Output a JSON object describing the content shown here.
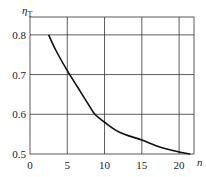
{
  "chart_data": {
    "type": "line",
    "title": "",
    "xlabel": "n",
    "ylabel": "η",
    "ylabel_subscript": "T",
    "xlim": [
      0,
      22
    ],
    "ylim": [
      0.5,
      0.845
    ],
    "grid": true,
    "x_ticks": [
      0,
      5,
      10,
      15,
      20
    ],
    "x_tick_labels": [
      "0",
      "5",
      "10",
      "15",
      "20"
    ],
    "y_ticks": [
      0.5,
      0.6,
      0.7,
      0.8
    ],
    "y_tick_labels": [
      "0.5",
      "0.6",
      "0.7",
      "0.8"
    ],
    "series": [
      {
        "name": "ηT vs n",
        "color": "#111111",
        "x": [
          2.5,
          3.5,
          5,
          6.5,
          8,
          8.7,
          10,
          12,
          15,
          17.5,
          20,
          21.5
        ],
        "y": [
          0.8,
          0.76,
          0.71,
          0.665,
          0.62,
          0.6,
          0.58,
          0.555,
          0.535,
          0.517,
          0.505,
          0.5
        ]
      }
    ]
  }
}
